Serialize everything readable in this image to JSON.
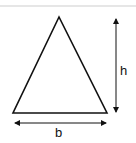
{
  "diagram": {
    "shape": "triangle",
    "labels": {
      "height": "h",
      "base": "b"
    },
    "colors": {
      "stroke": "#111111",
      "top_rule": "#e6e6e6"
    }
  }
}
